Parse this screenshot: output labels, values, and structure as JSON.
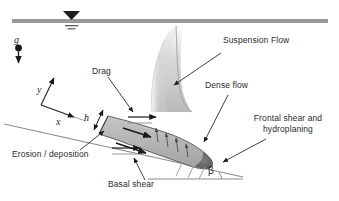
{
  "figure": {
    "name": "submarine-debris-flow-diagram",
    "background_color": "#ffffff",
    "width": 339,
    "height": 201
  },
  "seafloor_surface": {
    "label": "seabed-water-interface-line",
    "color": "#9a9a9a",
    "water_level_symbol": "water-table-triangle"
  },
  "gravity": {
    "symbol": "g",
    "description": "gravity-vector-downward"
  },
  "axes": {
    "x_label": "x",
    "y_label": "y"
  },
  "labels": {
    "suspension_flow": "Suspension Flow",
    "dense_flow": "Dense flow",
    "drag": "Drag",
    "frontal_shear_line1": "Frontal shear and",
    "frontal_shear_line2": "hydroplaning",
    "erosion_deposition": "Erosion / deposition",
    "basal_shear": "Basal shear",
    "thickness": "h",
    "slope_angle": "β"
  },
  "colors": {
    "surface_line": "#9a9a9a",
    "dense_flow_fill": "#b3b3b3",
    "dense_flow_edge": "#4d4d4d",
    "nose_dark": "#6b6b6b",
    "plume_light": "#d9d9d9",
    "arrow_dark": "#1a1a1a",
    "slope_line": "#7a7a7a",
    "text": "#2b2b2b"
  }
}
